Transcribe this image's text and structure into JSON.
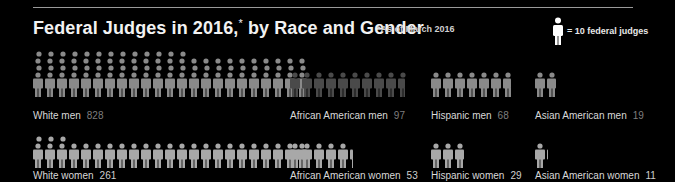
{
  "header": {
    "title": "Federal Judges in 2016,",
    "title_footnote_mark": "*",
    "title_suffix": " by Race and Gender",
    "note": "*As of March 2016",
    "legend_text": "= 10 federal judges",
    "legend_icon": "person-icon"
  },
  "colors": {
    "background": "#000000",
    "icon_default": "#8a8a8a",
    "icon_dark": "#4a4a4a",
    "icon_women": "#a8a8a8",
    "label": "#d8d8d8",
    "value": "#7e7e7e"
  },
  "chart_data": {
    "type": "pictograph",
    "title": "Federal Judges in 2016,* by Race and Gender",
    "subtitle": "*As of March 2016",
    "unit": "1 icon = 10 federal judges",
    "groups": [
      {
        "label": "White men",
        "value": 828,
        "shade": "icon_default"
      },
      {
        "label": "African American men",
        "value": 97,
        "shade": "icon_dark"
      },
      {
        "label": "Hispanic men",
        "value": 68,
        "shade": "icon_default"
      },
      {
        "label": "Asian American men",
        "value": 19,
        "shade": "icon_default"
      },
      {
        "label": "White women",
        "value": 261,
        "shade": "icon_women"
      },
      {
        "label": "African American women",
        "value": 53,
        "shade": "icon_women"
      },
      {
        "label": "Hispanic women",
        "value": 29,
        "shade": "icon_women"
      },
      {
        "label": "Asian American women",
        "value": 11,
        "shade": "icon_women"
      }
    ]
  }
}
